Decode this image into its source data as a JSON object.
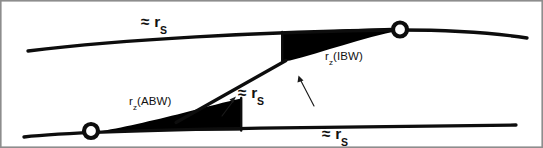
{
  "figure": {
    "type": "geological-cross-section-diagram",
    "background_color": "#ffffff",
    "line_color": "#0d0d0d",
    "fill_color": "#000000",
    "border_color": "#8d8d8d"
  },
  "labels": {
    "approx_top": {
      "symbol": "≈ r",
      "subscript": "S"
    },
    "approx_center": {
      "symbol": "≈ r",
      "subscript": "S"
    },
    "approx_bottom": {
      "symbol": "≈ r",
      "subscript": "S"
    },
    "rz_ibw": {
      "prefix": "r",
      "subscript": "z",
      "suffix": "(IBW)"
    },
    "rz_abw": {
      "prefix": "r",
      "subscript": "z",
      "suffix": "(ABW)"
    }
  },
  "nodes": [
    {
      "name": "cutoff-node-upper-right",
      "x": 400,
      "y": 30,
      "radius": 7.2,
      "fill": "#ffffff"
    },
    {
      "name": "cutoff-node-lower-left",
      "x": 91,
      "y": 131,
      "radius": 7.2,
      "fill": "#ffffff"
    }
  ],
  "geometry": {
    "top_bed_curve": "M 28 51 C 120 40, 260 31, 400 30 C 455 30, 495 33, 527 38",
    "bottom_bed_curve": "M 24 137 C 60 133, 150 130, 260 128 C 360 126, 460 125, 516 125",
    "ramp_diagonal": "M 176 122 L 285 60",
    "upper_wedge": "M 282 33 L 282 61 L 289 60 C 320 53, 362 38, 399 31 L 399 28 C 360 29, 320 31, 282 33 Z",
    "lower_wedge": "M 241 99 L 241 130 L 99 131 C 118 128, 152 120, 182 113 C 205 107, 226 102, 241 99 Z"
  },
  "leaders": [
    {
      "name": "leader-arrow-left",
      "from_x": 219,
      "from_y": 113,
      "to_x": 231,
      "to_y": 99
    },
    {
      "name": "leader-arrow-right",
      "from_x": 312,
      "from_y": 103,
      "to_x": 299,
      "to_y": 78
    }
  ]
}
